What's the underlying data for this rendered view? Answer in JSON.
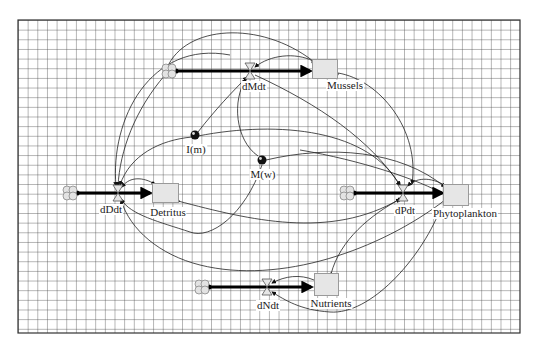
{
  "diagram": {
    "type": "stock-and-flow",
    "background": "grid",
    "colors": {
      "grid": "#555555",
      "stock_fill": "#e6e6e6",
      "flow": "#000000",
      "link": "#333333"
    },
    "stocks": [
      {
        "id": "mussels",
        "label": "Mussels"
      },
      {
        "id": "detritus",
        "label": "Detritus"
      },
      {
        "id": "phytoplankton",
        "label": "Phytoplankton"
      },
      {
        "id": "nutrients",
        "label": "Nutrients"
      }
    ],
    "flows": [
      {
        "id": "dMdt",
        "label": "dMdt",
        "to": "Mussels"
      },
      {
        "id": "dDdt",
        "label": "dDdt",
        "to": "Detritus"
      },
      {
        "id": "dPdt",
        "label": "dPdt",
        "to": "Phytoplankton"
      },
      {
        "id": "dNdt",
        "label": "dNdt",
        "to": "Nutrients"
      }
    ],
    "converters": [
      {
        "id": "Im",
        "label": "I(m)"
      },
      {
        "id": "Mw",
        "label": "M(w)"
      }
    ]
  }
}
